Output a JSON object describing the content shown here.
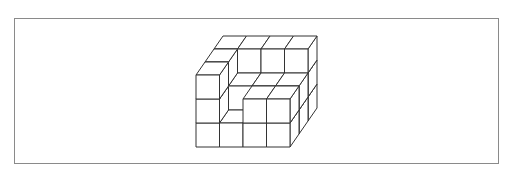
{
  "figure": {
    "grid": {
      "columns": 4,
      "depth": 3,
      "max_height": 3
    },
    "heights_by_depth": [
      [
        3,
        1,
        2,
        2
      ],
      [
        3,
        2,
        2,
        2
      ],
      [
        3,
        3,
        3,
        3
      ]
    ],
    "projection": {
      "origin": [
        196,
        147
      ],
      "unit_x": 23.5,
      "unit_z": 24,
      "depth_dx": 9,
      "depth_dy": -13
    },
    "colors": {
      "face": "#ffffff",
      "edge": "#333333",
      "frame": "#8a8a8a"
    }
  }
}
